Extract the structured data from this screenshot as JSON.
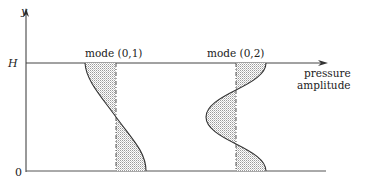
{
  "axes": {
    "y_label": "y",
    "y_top_label": "H",
    "y_bottom_label": "0",
    "x_label_line1": "pressure",
    "x_label_line2": "amplitude"
  },
  "modes": [
    {
      "label": "mode (0,1)",
      "description": "half-wave pressure amplitude profile, one zero crossing at mid-height"
    },
    {
      "label": "mode (0,2)",
      "description": "full-wave pressure amplitude profile, two zero crossings"
    }
  ],
  "colors": {
    "line": "#333333",
    "fill_pattern": "#9a9a9a",
    "background": "#ffffff"
  }
}
